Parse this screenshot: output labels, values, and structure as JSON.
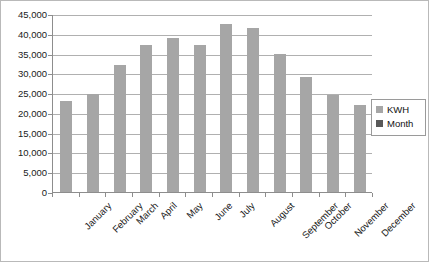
{
  "chart_data": {
    "type": "bar",
    "title": "",
    "xlabel": "",
    "ylabel": "",
    "categories": [
      "January",
      "February",
      "March",
      "April",
      "May",
      "June",
      "July",
      "August",
      "September",
      "October",
      "November",
      "December"
    ],
    "values": [
      23000,
      24700,
      32100,
      37200,
      39000,
      37200,
      42500,
      41500,
      35000,
      29000,
      24500,
      22100
    ],
    "series": [
      {
        "name": "KWH",
        "values": [
          23000,
          24700,
          32100,
          37200,
          39000,
          37200,
          42500,
          41500,
          35000,
          29000,
          24500,
          22100
        ],
        "color": "#a6a6a6"
      }
    ],
    "ylim": [
      0,
      45000
    ],
    "ytick_values": [
      0,
      5000,
      10000,
      15000,
      20000,
      25000,
      30000,
      35000,
      40000,
      45000
    ],
    "ytick_labels": [
      "0",
      "5,000",
      "10,000",
      "15,000",
      "20,000",
      "25,000",
      "30,000",
      "35,000",
      "40,000",
      "45,000"
    ],
    "grid": true,
    "grid_axis": "y",
    "legend_position": "right",
    "legend_entries": [
      {
        "label": "KWH",
        "color": "#a6a6a6"
      },
      {
        "label": "Month",
        "color": "#595959"
      }
    ],
    "xtick_label_rotation": -45,
    "plot_background": "#ffffff",
    "gridline_color": "#b0b0b0",
    "axis_color": "#8d8d8d"
  }
}
